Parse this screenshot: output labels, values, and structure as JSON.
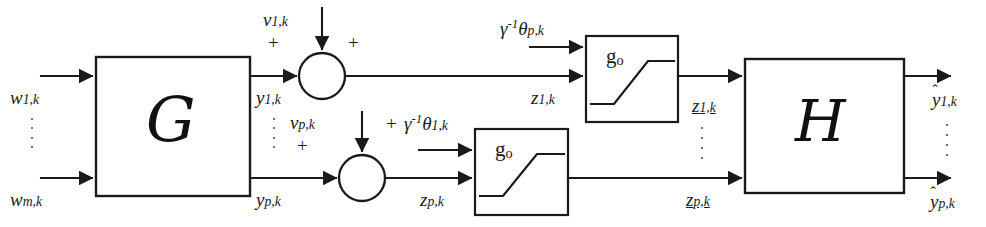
{
  "figure": {
    "type": "block-diagram",
    "domain": "control-systems"
  },
  "blocks": {
    "plant": {
      "label": "G",
      "name": "plant-block-g"
    },
    "output_map": {
      "label": "H",
      "name": "output-block-h"
    },
    "saturation_top": {
      "label": "g",
      "sub": "o",
      "name": "saturation-block-top"
    },
    "saturation_bottom": {
      "label": "g",
      "sub": "o",
      "name": "saturation-block-bottom"
    }
  },
  "inputs": {
    "first": {
      "base": "w",
      "sub": "1,k"
    },
    "last": {
      "base": "w",
      "sub": "m,k"
    }
  },
  "plant_outputs": {
    "first": {
      "base": "y",
      "sub": "1,k"
    },
    "last": {
      "base": "y",
      "sub": "p,k"
    }
  },
  "noise": {
    "first": {
      "base": "v",
      "sub": "1,k"
    },
    "last": {
      "base": "v",
      "sub": "p,k"
    }
  },
  "dither": {
    "top": {
      "gamma": "γ",
      "exp": "-1",
      "theta": "θ",
      "sub": "p,k"
    },
    "bottom": {
      "gamma": "γ",
      "exp": "-1",
      "theta": "θ",
      "sub": "1,k"
    }
  },
  "sum_signals": {
    "first": {
      "base": "z",
      "sub": "1,k"
    },
    "last": {
      "base": "z",
      "sub": "p,k"
    }
  },
  "quantized_signals": {
    "first": {
      "base": "z",
      "sub": "1,k"
    },
    "last": {
      "base": "z",
      "sub": "p,k"
    }
  },
  "estimated_outputs": {
    "first": {
      "base": "y",
      "sub": "1,k",
      "accent": "ˆ"
    },
    "last": {
      "base": "y",
      "sub": "p,k",
      "accent": "ˆ"
    }
  },
  "signs": {
    "top_junction_noise": "+",
    "top_junction_signal": "+",
    "bottom_junction_noise": "+",
    "bottom_junction_dither": "+"
  },
  "colors": {
    "line": "#1a1a1a",
    "background": "#ffffff",
    "text": "#1a1a1a"
  }
}
